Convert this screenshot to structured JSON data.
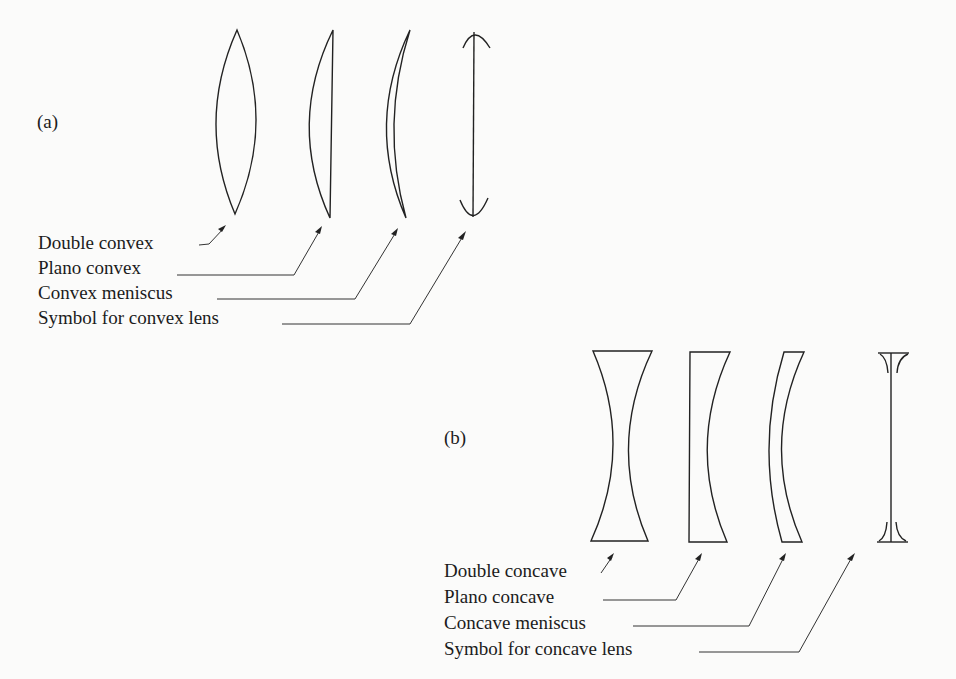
{
  "figure": {
    "panel_a": {
      "tag": "(a)",
      "title": "Convex lenses",
      "labels": [
        {
          "text": "Double convex",
          "target": "double-convex-lens"
        },
        {
          "text": "Plano convex",
          "target": "plano-convex-lens"
        },
        {
          "text": "Convex meniscus",
          "target": "convex-meniscus-lens"
        },
        {
          "text": "Symbol for convex lens",
          "target": "convex-lens-symbol"
        }
      ]
    },
    "panel_b": {
      "tag": "(b)",
      "title": "Concave lenses",
      "labels": [
        {
          "text": "Double concave",
          "target": "double-concave-lens"
        },
        {
          "text": "Plano concave",
          "target": "plano-concave-lens"
        },
        {
          "text": "Concave meniscus",
          "target": "concave-meniscus-lens"
        },
        {
          "text": "Symbol for concave lens",
          "target": "concave-lens-symbol"
        }
      ]
    },
    "colors": {
      "ink": "#222222",
      "paper": "#fbfbfa"
    }
  }
}
